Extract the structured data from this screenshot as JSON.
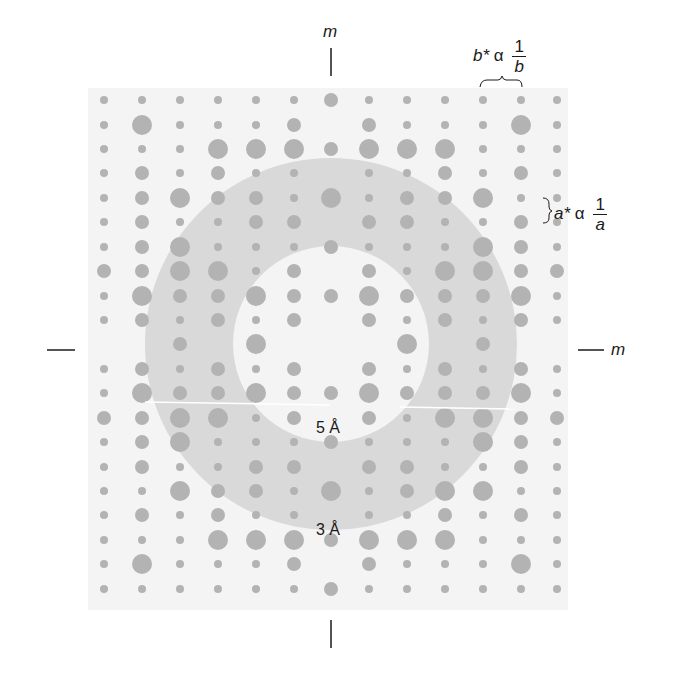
{
  "figure": {
    "background_color": "#ffffff",
    "field_color": "#f4f4f4",
    "ring_color": "#d9d9d9",
    "dot_color": "#b3b3b3",
    "line_color": "#1a1a1a"
  },
  "labels": {
    "mirror_top": "m",
    "mirror_right": "m",
    "b_star": "b*",
    "alpha": "α",
    "one": "1",
    "b": "b",
    "a_star": "a*",
    "a": "a",
    "ring_inner_label": "5 Å",
    "ring_outer_label": "3 Å"
  },
  "geometry": {
    "field": {
      "x": 88,
      "y": 88,
      "w": 480,
      "h": 522
    },
    "center": {
      "x": 331,
      "y": 344
    },
    "ring_inner_radius": 98,
    "ring_outer_radius": 186,
    "columns_x": [
      104,
      142,
      180,
      218,
      256,
      294,
      331,
      369,
      407,
      445,
      483,
      521,
      557
    ],
    "rows_y": [
      100,
      125,
      149,
      173,
      198,
      222,
      247,
      271,
      296,
      320,
      344,
      369,
      393,
      418,
      442,
      467,
      491,
      515,
      540,
      564,
      589
    ],
    "dot_radius_by_size": [
      0,
      4,
      7,
      10
    ]
  },
  "chart_data": {
    "type": "scatter",
    "columns": 13,
    "rows": 21,
    "size_scale": "0=absent, 1=weak, 2=medium, 3=strong",
    "intensities": [
      [
        1,
        1,
        1,
        1,
        1,
        1,
        2,
        1,
        1,
        1,
        1,
        1,
        1
      ],
      [
        1,
        3,
        1,
        1,
        1,
        2,
        0,
        2,
        1,
        1,
        1,
        3,
        1
      ],
      [
        1,
        1,
        1,
        3,
        3,
        3,
        2,
        3,
        3,
        3,
        1,
        1,
        1
      ],
      [
        1,
        2,
        1,
        2,
        1,
        1,
        0,
        1,
        1,
        2,
        1,
        2,
        1
      ],
      [
        1,
        2,
        3,
        2,
        2,
        1,
        3,
        1,
        2,
        2,
        3,
        1,
        1
      ],
      [
        1,
        2,
        1,
        1,
        2,
        2,
        0,
        2,
        2,
        1,
        1,
        2,
        1
      ],
      [
        1,
        2,
        3,
        1,
        1,
        1,
        2,
        1,
        1,
        1,
        3,
        2,
        1
      ],
      [
        2,
        2,
        3,
        3,
        1,
        2,
        0,
        2,
        1,
        3,
        3,
        2,
        2
      ],
      [
        1,
        3,
        2,
        2,
        3,
        2,
        2,
        3,
        2,
        2,
        2,
        3,
        1
      ],
      [
        1,
        2,
        1,
        2,
        1,
        2,
        0,
        2,
        1,
        2,
        1,
        2,
        1
      ],
      [
        0,
        0,
        2,
        0,
        3,
        0,
        0,
        0,
        3,
        0,
        2,
        0,
        0
      ],
      [
        1,
        2,
        1,
        2,
        1,
        2,
        0,
        2,
        1,
        2,
        1,
        2,
        1
      ],
      [
        1,
        3,
        2,
        2,
        3,
        2,
        2,
        3,
        2,
        2,
        2,
        3,
        1
      ],
      [
        2,
        2,
        3,
        3,
        1,
        2,
        0,
        2,
        1,
        3,
        3,
        2,
        2
      ],
      [
        1,
        2,
        3,
        1,
        1,
        1,
        2,
        1,
        1,
        1,
        3,
        2,
        1
      ],
      [
        1,
        2,
        1,
        1,
        2,
        2,
        0,
        2,
        2,
        1,
        1,
        2,
        1
      ],
      [
        1,
        1,
        3,
        2,
        2,
        1,
        3,
        1,
        2,
        3,
        3,
        1,
        1
      ],
      [
        1,
        2,
        1,
        2,
        1,
        1,
        0,
        1,
        1,
        2,
        1,
        2,
        1
      ],
      [
        1,
        1,
        1,
        3,
        3,
        3,
        2,
        3,
        3,
        3,
        1,
        1,
        1
      ],
      [
        1,
        3,
        1,
        1,
        1,
        2,
        0,
        2,
        1,
        1,
        1,
        3,
        1
      ],
      [
        1,
        1,
        1,
        1,
        1,
        1,
        2,
        1,
        1,
        1,
        1,
        1,
        1
      ]
    ],
    "annotations": [
      {
        "text": "5 Å",
        "position": "inner edge of ring, bottom"
      },
      {
        "text": "3 Å",
        "position": "outer edge of ring, bottom"
      },
      {
        "text": "m",
        "position": "top mirror line"
      },
      {
        "text": "m",
        "position": "right mirror line"
      },
      {
        "text": "b* α 1/b",
        "position": "top right, horizontal spacing bracket"
      },
      {
        "text": "a* α 1/a",
        "position": "right, vertical spacing bracket"
      }
    ],
    "grid": false,
    "legend": null
  }
}
